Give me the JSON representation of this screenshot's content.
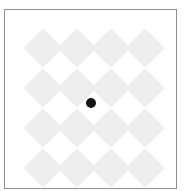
{
  "app": {
    "title": "Diamond Pattern Canvas",
    "width": 189,
    "height": 191,
    "background_color": "#ffffff"
  },
  "panel": {
    "name": "canvas-panel",
    "left": 4,
    "top": 9,
    "width": 173,
    "height": 180,
    "border_color": "#8f8f8f",
    "border_width": 1,
    "background_color": "#ffffff"
  },
  "pattern": {
    "type": "diamond-grid",
    "rows": 4,
    "columns": 4,
    "tile_color": "#eeeeee",
    "tile_size": 28,
    "column_spacing": 34,
    "row_spacing": 40,
    "first_center_x": 38,
    "first_center_y": 38,
    "centers": [
      {
        "x": 38,
        "y": 38
      },
      {
        "x": 72,
        "y": 38
      },
      {
        "x": 106,
        "y": 38
      },
      {
        "x": 140,
        "y": 38
      },
      {
        "x": 38,
        "y": 78
      },
      {
        "x": 72,
        "y": 78
      },
      {
        "x": 106,
        "y": 78
      },
      {
        "x": 140,
        "y": 78
      },
      {
        "x": 38,
        "y": 118
      },
      {
        "x": 72,
        "y": 118
      },
      {
        "x": 106,
        "y": 118
      },
      {
        "x": 140,
        "y": 118
      },
      {
        "x": 38,
        "y": 158
      },
      {
        "x": 72,
        "y": 158
      },
      {
        "x": 106,
        "y": 158
      },
      {
        "x": 140,
        "y": 158
      }
    ]
  },
  "cursor": {
    "name": "cursor-dot",
    "x": 86,
    "y": 93,
    "radius": 5,
    "color": "#141414",
    "label": "cursor"
  }
}
